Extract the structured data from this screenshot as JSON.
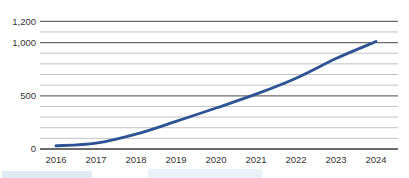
{
  "chart_data": {
    "type": "line",
    "title": "",
    "xlabel": "",
    "ylabel": "",
    "categories": [
      "2016",
      "2017",
      "2018",
      "2019",
      "2020",
      "2021",
      "2022",
      "2023",
      "2024"
    ],
    "series": [
      {
        "name": "value",
        "values": [
          30,
          55,
          140,
          260,
          385,
          515,
          665,
          850,
          1010
        ]
      }
    ],
    "ylim": [
      0,
      1200
    ],
    "y_gridline_step": 100,
    "y_tick_labels": [
      {
        "value": 0,
        "label": "0"
      },
      {
        "value": 500,
        "label": "500"
      },
      {
        "value": 1000,
        "label": "1,000"
      },
      {
        "value": 1200,
        "label": "1,200"
      }
    ],
    "grid": true,
    "legend": false,
    "smooth": true
  },
  "colors": {
    "background": "#ffffff",
    "line": "#2E5394",
    "minor_gridline": "#c3c3c3",
    "major_gridline": "#6d6d6d",
    "axis_line": "#3a3a3a",
    "tick_label": "#343434",
    "artifact_blue": "#bad0e8"
  }
}
